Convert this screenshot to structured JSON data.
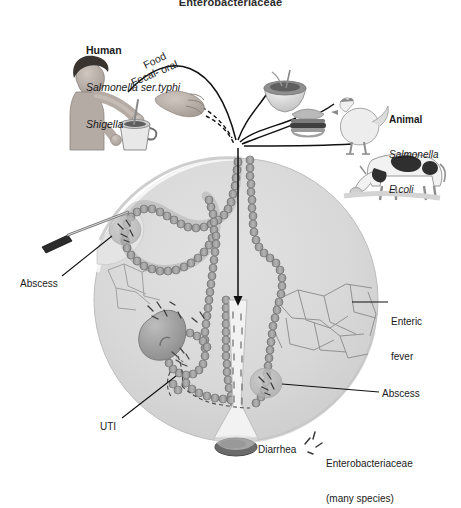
{
  "title": "Enterobacteriaceae",
  "sources": {
    "human": {
      "heading": "Human",
      "organism_1": "Salmonella ser.typhi",
      "organism_2": "Shigella",
      "icon": "person-stirring-pot-icon"
    },
    "animal": {
      "heading": "Animal",
      "organism_1": "Salmonella",
      "organism_2": "E.coli",
      "icon": "chicken-and-cow-icon"
    }
  },
  "transmission": {
    "route_1": "Food",
    "route_2": "Fecal- oral",
    "vehicles": [
      "salad-bowl-icon",
      "hamburger-icon",
      "hand-icon",
      "pot-icon"
    ]
  },
  "body": {
    "outline": "human-torso-circle",
    "organs": [
      "intestinal-tract",
      "kidney",
      "bladder",
      "rectum",
      "lymphatic-network"
    ],
    "arrow": "ingestion-arrow-down"
  },
  "outcomes": [
    {
      "id": "abscess-left",
      "label": "Abscess",
      "side": "left"
    },
    {
      "id": "uti",
      "label": "UTI",
      "side": "left"
    },
    {
      "id": "enteric-fever",
      "label": "Enteric\nfever",
      "label_line1": "Enteric",
      "label_line2": "fever",
      "side": "right"
    },
    {
      "id": "abscess-right",
      "label": "Abscess",
      "side": "right"
    },
    {
      "id": "diarrhea",
      "label": "Diarrhea",
      "side": "bottom"
    }
  ],
  "legend": {
    "glyph": "bacilli-rods-icon",
    "line1": "Enterobacteriaceae",
    "line2": "(many species)"
  },
  "colors": {
    "background": "#ffffff",
    "body_fill": "#d6d6d6",
    "body_edge": "#b2b2b2",
    "gut_fill": "#9a9a9a",
    "gut_edge": "#6f6f6f",
    "stroke": "#1a1a1a",
    "text": "#1a1a1a",
    "kidney": "#a0a0a0",
    "cow_dark": "#2f2f2f"
  }
}
